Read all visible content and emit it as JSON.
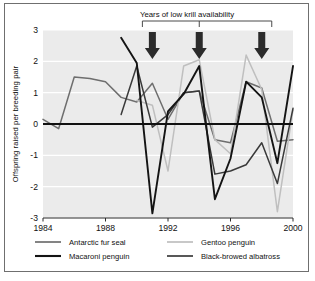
{
  "figure": {
    "annotation": "Years of low krill availability",
    "arrow_count": 3
  },
  "axes": {
    "ylabel": "Offspring raised per breeding pair",
    "xlabel": "",
    "y_ticks": [
      "3",
      "2",
      "1",
      "0",
      "-1",
      "-2",
      "-3"
    ],
    "x_ticks": [
      "1984",
      "1988",
      "1992",
      "1996",
      "2000"
    ]
  },
  "legend": {
    "items": [
      {
        "label": "Antarctic fur seal",
        "color": "#6e6e6e"
      },
      {
        "label": "Gentoo penguin",
        "color": "#bfbfbf"
      },
      {
        "label": "Macaroni penguin",
        "color": "#141414"
      },
      {
        "label": "Black-browed albatross",
        "color": "#3a3a3a"
      }
    ]
  },
  "colors": {
    "plot_background": "#ebebeb",
    "gridline": "#ffffff",
    "zero_line": "#111111",
    "frame": "#6f6f6f",
    "arrow": "#2b2b2b"
  },
  "chart_data": {
    "type": "line",
    "title": "",
    "subtitle": "",
    "xlabel": "",
    "ylabel": "Offspring raised per breeding pair",
    "xlim": [
      1984,
      2000
    ],
    "ylim": [
      -3,
      3
    ],
    "grid": true,
    "legend_position": "bottom",
    "annotations": [
      {
        "text": "Years of low krill availability",
        "type": "bracket-label",
        "x_range": [
          1991,
          1998
        ]
      },
      {
        "text": "",
        "type": "down-arrow",
        "x": 1991
      },
      {
        "text": "",
        "type": "down-arrow",
        "x": 1994
      },
      {
        "text": "",
        "type": "down-arrow",
        "x": 1998
      }
    ],
    "x": [
      1984,
      1985,
      1986,
      1987,
      1988,
      1989,
      1990,
      1991,
      1992,
      1993,
      1994,
      1995,
      1996,
      1997,
      1998,
      1999,
      2000
    ],
    "series": [
      {
        "name": "Antarctic fur seal",
        "color": "#6e6e6e",
        "values": [
          0.15,
          -0.15,
          1.5,
          1.45,
          1.35,
          0.85,
          0.7,
          1.3,
          0.15,
          1.0,
          1.05,
          -0.5,
          -0.6,
          1.35,
          1.15,
          -0.55,
          -0.5
        ]
      },
      {
        "name": "Gentoo penguin",
        "color": "#bfbfbf",
        "values": [
          null,
          null,
          null,
          null,
          null,
          null,
          0.75,
          0.6,
          -1.5,
          1.85,
          2.05,
          -0.5,
          -0.95,
          2.2,
          1.1,
          -2.8,
          0.45
        ]
      },
      {
        "name": "Macaroni penguin",
        "color": "#141414",
        "values": [
          null,
          null,
          null,
          null,
          null,
          2.75,
          1.95,
          -2.85,
          0.4,
          0.95,
          1.85,
          -2.4,
          -1.1,
          1.35,
          0.85,
          -1.25,
          1.85
        ]
      },
      {
        "name": "Black-browed albatross",
        "color": "#3a3a3a",
        "values": [
          null,
          null,
          null,
          null,
          null,
          0.3,
          1.85,
          -0.1,
          0.3,
          1.0,
          1.05,
          -1.6,
          -1.5,
          -1.3,
          -0.6,
          -1.9,
          0.5
        ]
      }
    ]
  }
}
